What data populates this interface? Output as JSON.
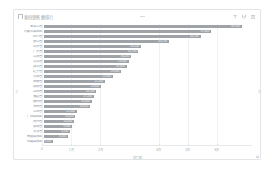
{
  "card": {
    "title": "省份销售额排行",
    "pin_icon": "pin-icon",
    "header_divider": "divider"
  },
  "toolbar": {
    "filter_label": "筛选",
    "chart_type_label": "图表类型",
    "more_label": "更多"
  },
  "pager": {
    "prev_label": "上一页",
    "next_label": "下一页"
  },
  "colors": {
    "bar": "#9fa3a8",
    "card_border": "#e2e4e8",
    "grid": "#f0f1f3",
    "axis": "#e6e8ea",
    "label_text": "#8d939b",
    "value_text": "#f2f3f4"
  },
  "chart_data": {
    "type": "bar",
    "orientation": "horizontal",
    "title": "省份销售额排行",
    "xlabel": "销售额",
    "ylabel": "",
    "xlim": [
      0,
      72000
    ],
    "grid": true,
    "legend": "none",
    "xticks": [
      0,
      10000,
      20000,
      40000,
      50000,
      60000
    ],
    "xticklabels": [
      "0",
      "1万",
      "2万",
      "4万",
      "5万",
      "6万"
    ],
    "categories": [
      "黑龙江省",
      "内蒙古自治区",
      "四川省",
      "浙江省",
      "山东省",
      "广东省",
      "江苏省",
      "河北省",
      "湖北省",
      "辽宁省",
      "河南省",
      "安徽省",
      "湖南省",
      "山西省",
      "福建省",
      "陕西省",
      "吉林省",
      "江西省",
      "广西自治区",
      "贵州省",
      "云南省",
      "甘肃省",
      "新疆自治区",
      "西藏自治区"
    ],
    "values": [
      68500,
      57800,
      54200,
      43200,
      33500,
      32700,
      30200,
      29300,
      28600,
      26800,
      23900,
      21100,
      19800,
      18100,
      17200,
      16500,
      16000,
      11300,
      10900,
      10400,
      9800,
      9100,
      8300,
      3100
    ],
    "datalabels": [
      "68,500",
      "57,800",
      "54,200",
      "43,200",
      "33,500",
      "32,700",
      "30,200",
      "29,300",
      "28,600",
      "26,800",
      "23,900",
      "21,100",
      "19,800",
      "18,100",
      "17,200",
      "16,500",
      "16,000",
      "11,300",
      "10,900",
      "10,400",
      "9,800",
      "9,100",
      "8,300",
      "3,100"
    ]
  }
}
